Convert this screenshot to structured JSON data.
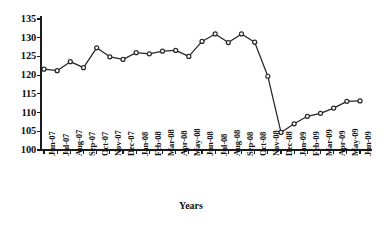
{
  "chart_data": {
    "type": "line",
    "title": "",
    "subtitle": "",
    "xlabel": "Years",
    "ylabel": "",
    "ylim": [
      100,
      135
    ],
    "ytick_step": 5,
    "yticks": [
      "100",
      "105",
      "110",
      "115",
      "120",
      "125",
      "130",
      "135"
    ],
    "grid": false,
    "legend": null,
    "marker": "circle-open",
    "line_color": "#262626",
    "marker_color": "#262626",
    "categories": [
      "Jun-07",
      "Jul-07",
      "Aug-07",
      "Sep-07",
      "Oct-07",
      "Nov-07",
      "Dec-07",
      "Jan-08",
      "Feb-08",
      "Mar-08",
      "Apr-08",
      "May-08",
      "Jun-08",
      "Jul-08",
      "Aug-08",
      "Sep-08",
      "Oct-08",
      "Nov-08",
      "Dec-08",
      "Jan-09",
      "Feb-09",
      "Mar-09",
      "Apr-09",
      "May-09",
      "Jun-09"
    ],
    "values": [
      121.6,
      121.2,
      123.6,
      122.0,
      127.3,
      124.9,
      124.2,
      126.0,
      125.7,
      126.4,
      126.6,
      125.0,
      129.0,
      131.0,
      128.7,
      131.0,
      128.8,
      119.7,
      104.7,
      107.0,
      109.0,
      109.8,
      111.2,
      113.0,
      113.1
    ]
  },
  "axis": {
    "x_title": "Years"
  }
}
